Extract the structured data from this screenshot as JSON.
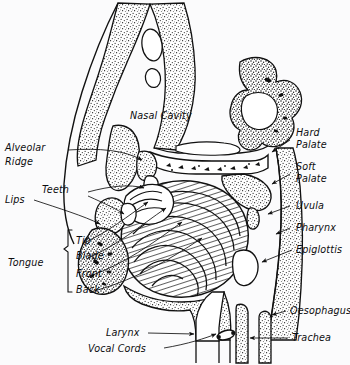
{
  "figure": {
    "background_color": "#fbfbfc",
    "ink_color": "#111111"
  },
  "labels": {
    "nasal_cavity": "Nasal Cavity",
    "alveolar_ridge_line1": "Alveolar",
    "alveolar_ridge_line2": "Ridge",
    "lips": "Lips",
    "teeth": "Teeth",
    "tongue": "Tongue",
    "tip": "Tip",
    "blade": "Blade",
    "front": "Front",
    "back": "Back",
    "hard_palate_line1": "Hard",
    "hard_palate_line2": "Palate",
    "soft_palate_line1": "Soft",
    "soft_palate_line2": "Palate",
    "uvula": "Uvula",
    "pharynx": "Pharynx",
    "epiglottis": "Epiglottis",
    "oesophagus": "Oesophagus",
    "trachea": "Trachea",
    "larynx": "Larynx",
    "vocal_cords": "Vocal Cords"
  },
  "tongue_parts": [
    "Tip",
    "Blade",
    "Front",
    "Back"
  ],
  "right_labels": [
    "Hard Palate",
    "Soft Palate",
    "Uvula",
    "Pharynx",
    "Epiglottis",
    "Oesophagus",
    "Trachea"
  ],
  "left_labels": [
    "Alveolar Ridge",
    "Lips",
    "Teeth",
    "Tongue"
  ],
  "bottom_labels": [
    "Larynx",
    "Vocal Cords"
  ]
}
